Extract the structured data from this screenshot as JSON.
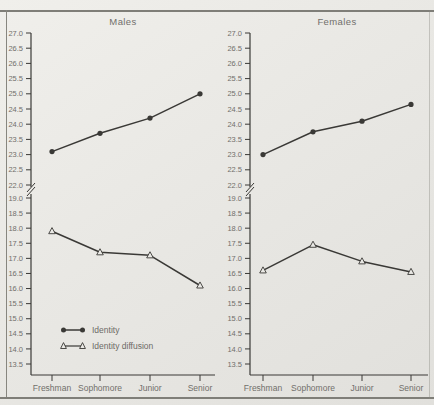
{
  "figure": {
    "paper_color": "#eae9e5",
    "line_color": "#3a3936",
    "text_color": "#716f6b",
    "frame_color": "#87867f"
  },
  "chart_data": [
    {
      "type": "line",
      "title": "Males",
      "categories": [
        "Freshman",
        "Sophomore",
        "Junior",
        "Senior"
      ],
      "series": [
        {
          "name": "Identity",
          "marker": "filled-circle",
          "values": [
            23.1,
            23.7,
            24.2,
            25.0
          ]
        },
        {
          "name": "Identity diffusion",
          "marker": "open-triangle",
          "values": [
            17.9,
            17.2,
            17.1,
            16.1
          ]
        }
      ],
      "y_axis": {
        "upper_ticks": [
          27.0,
          26.5,
          26.0,
          25.5,
          25.0,
          24.5,
          24.0,
          23.5,
          23.0,
          22.5,
          22.0
        ],
        "lower_ticks": [
          19.0,
          18.5,
          18.0,
          17.5,
          17.0,
          16.5,
          16.0,
          15.5,
          15.0,
          14.5,
          14.0,
          13.5
        ],
        "tick_step": 0.5,
        "axis_break": true,
        "upper_range": [
          22.0,
          27.0
        ],
        "lower_range": [
          13.5,
          19.0
        ]
      },
      "legend": {
        "visible": true,
        "entries": [
          "Identity",
          "Identity diffusion"
        ]
      }
    },
    {
      "type": "line",
      "title": "Females",
      "categories": [
        "Freshman",
        "Sophomore",
        "Junior",
        "Senior"
      ],
      "series": [
        {
          "name": "Identity",
          "marker": "filled-circle",
          "values": [
            23.0,
            23.75,
            24.1,
            24.65
          ]
        },
        {
          "name": "Identity diffusion",
          "marker": "open-triangle",
          "values": [
            16.6,
            17.45,
            16.9,
            16.55
          ]
        }
      ],
      "y_axis": {
        "upper_ticks": [
          27.0,
          26.5,
          26.0,
          25.5,
          25.0,
          24.5,
          24.0,
          23.5,
          23.0,
          22.5,
          22.0
        ],
        "lower_ticks": [
          19.0,
          18.5,
          18.0,
          17.5,
          17.0,
          16.5,
          16.0,
          15.5,
          15.0,
          14.5,
          14.0,
          13.5
        ],
        "tick_step": 0.5,
        "axis_break": true,
        "upper_range": [
          22.0,
          27.0
        ],
        "lower_range": [
          13.5,
          19.0
        ]
      },
      "legend": {
        "visible": false,
        "entries": []
      }
    }
  ]
}
